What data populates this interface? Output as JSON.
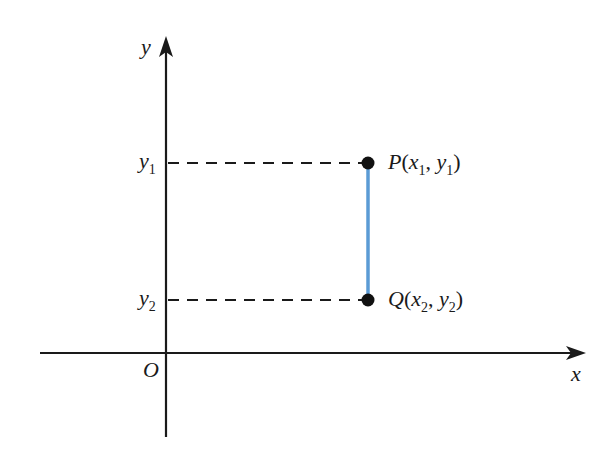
{
  "diagram": {
    "type": "coordinate-plane",
    "axes": {
      "x_label": "x",
      "y_label": "y",
      "origin_label": "O"
    },
    "y_ticks": [
      {
        "base": "y",
        "sub": "1"
      },
      {
        "base": "y",
        "sub": "2"
      }
    ],
    "points": [
      {
        "name": "P",
        "x_base": "x",
        "x_sub": "1",
        "y_base": "y",
        "y_sub": "1"
      },
      {
        "name": "Q",
        "x_base": "x",
        "x_sub": "2",
        "y_base": "y",
        "y_sub": "2"
      }
    ],
    "colors": {
      "axis": "#1a1a1a",
      "segment": "#5b9bd5",
      "point": "#111111"
    }
  }
}
